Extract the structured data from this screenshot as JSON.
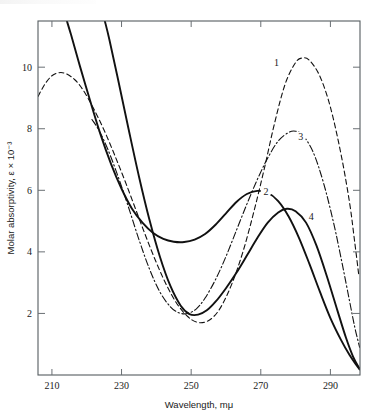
{
  "chart_data": {
    "type": "line",
    "title": "",
    "subtitle": "",
    "xlabel": "Wavelength, mμ",
    "ylabel": "Molar absorptivity, ε × 10⁻³",
    "xlim": [
      206,
      298.5
    ],
    "ylim": [
      0,
      11.5
    ],
    "xticks": [
      210,
      230,
      250,
      270,
      290
    ],
    "xticklabels": [
      "210",
      "230",
      "250",
      "270",
      "290"
    ],
    "yticks": [
      2,
      4,
      6,
      8,
      10
    ],
    "yticklabels": [
      "2",
      "4",
      "6",
      "8",
      "10"
    ],
    "grid": false,
    "legend_position": "inline-curve-labels",
    "annotations": [
      {
        "text": "1",
        "x": 274.5,
        "y": 10.05
      },
      {
        "text": "2",
        "x": 271.5,
        "y": 5.85
      },
      {
        "text": "3",
        "x": 281.5,
        "y": 7.65
      },
      {
        "text": "4",
        "x": 284.5,
        "y": 5.05
      }
    ],
    "series": [
      {
        "name": "1",
        "label": "1",
        "style": "dashed",
        "color": "#111111",
        "points": [
          [
            206.0,
            9.05
          ],
          [
            208.0,
            9.45
          ],
          [
            210.0,
            9.72
          ],
          [
            212.0,
            9.82
          ],
          [
            214.0,
            9.79
          ],
          [
            216.5,
            9.6
          ],
          [
            219.0,
            9.25
          ],
          [
            222.0,
            8.65
          ],
          [
            225.0,
            7.95
          ],
          [
            228.0,
            7.15
          ],
          [
            231.0,
            6.3
          ],
          [
            234.0,
            5.4
          ],
          [
            237.0,
            4.5
          ],
          [
            240.0,
            3.65
          ],
          [
            243.0,
            2.9
          ],
          [
            246.0,
            2.3
          ],
          [
            249.0,
            1.9
          ],
          [
            251.5,
            1.72
          ],
          [
            254.0,
            1.72
          ],
          [
            256.5,
            1.9
          ],
          [
            259.0,
            2.3
          ],
          [
            262.0,
            3.05
          ],
          [
            265.0,
            4.05
          ],
          [
            268.0,
            5.3
          ],
          [
            271.0,
            6.7
          ],
          [
            274.0,
            8.2
          ],
          [
            277.0,
            9.45
          ],
          [
            280.0,
            10.15
          ],
          [
            282.0,
            10.3
          ],
          [
            284.0,
            10.22
          ],
          [
            287.0,
            9.7
          ],
          [
            290.0,
            8.7
          ],
          [
            293.0,
            7.2
          ],
          [
            295.5,
            5.6
          ],
          [
            297.0,
            4.3
          ],
          [
            298.2,
            3.2
          ]
        ]
      },
      {
        "name": "2",
        "label": "2",
        "style": "solid",
        "color": "#111111",
        "points": [
          [
            214.3,
            11.5
          ],
          [
            215.5,
            11.05
          ],
          [
            218.0,
            10.05
          ],
          [
            221.0,
            8.9
          ],
          [
            224.0,
            7.8
          ],
          [
            227.0,
            6.85
          ],
          [
            230.0,
            6.05
          ],
          [
            233.0,
            5.4
          ],
          [
            236.0,
            4.95
          ],
          [
            239.0,
            4.62
          ],
          [
            242.0,
            4.42
          ],
          [
            245.0,
            4.33
          ],
          [
            248.0,
            4.32
          ],
          [
            251.0,
            4.4
          ],
          [
            254.0,
            4.58
          ],
          [
            257.0,
            4.88
          ],
          [
            260.0,
            5.25
          ],
          [
            263.0,
            5.62
          ],
          [
            266.0,
            5.88
          ],
          [
            269.0,
            5.98
          ],
          [
            272.0,
            5.92
          ],
          [
            275.0,
            5.65
          ],
          [
            278.0,
            5.15
          ],
          [
            281.0,
            4.45
          ],
          [
            284.0,
            3.6
          ],
          [
            287.0,
            2.7
          ],
          [
            290.0,
            1.85
          ],
          [
            293.0,
            1.15
          ],
          [
            295.5,
            0.65
          ],
          [
            297.5,
            0.32
          ],
          [
            298.4,
            0.18
          ]
        ]
      },
      {
        "name": "3",
        "label": "3",
        "style": "dashdot",
        "color": "#111111",
        "points": [
          [
            221.5,
            8.3
          ],
          [
            223.5,
            7.95
          ],
          [
            226.0,
            7.35
          ],
          [
            229.0,
            6.45
          ],
          [
            232.0,
            5.45
          ],
          [
            235.0,
            4.4
          ],
          [
            238.0,
            3.45
          ],
          [
            241.0,
            2.7
          ],
          [
            244.0,
            2.22
          ],
          [
            246.5,
            2.02
          ],
          [
            249.0,
            2.0
          ],
          [
            251.5,
            2.15
          ],
          [
            254.0,
            2.5
          ],
          [
            257.0,
            3.1
          ],
          [
            260.0,
            3.85
          ],
          [
            263.0,
            4.7
          ],
          [
            266.0,
            5.55
          ],
          [
            269.0,
            6.35
          ],
          [
            272.0,
            7.05
          ],
          [
            275.0,
            7.6
          ],
          [
            278.0,
            7.88
          ],
          [
            280.0,
            7.92
          ],
          [
            282.0,
            7.8
          ],
          [
            285.0,
            7.25
          ],
          [
            288.0,
            6.25
          ],
          [
            291.0,
            4.9
          ],
          [
            293.5,
            3.55
          ],
          [
            295.5,
            2.4
          ],
          [
            297.0,
            1.55
          ],
          [
            298.4,
            0.9
          ]
        ]
      },
      {
        "name": "4",
        "label": "4",
        "style": "solid",
        "color": "#111111",
        "points": [
          [
            225.2,
            11.5
          ],
          [
            226.5,
            10.9
          ],
          [
            229.0,
            9.6
          ],
          [
            232.0,
            8.0
          ],
          [
            235.0,
            6.45
          ],
          [
            238.0,
            5.05
          ],
          [
            241.0,
            3.85
          ],
          [
            244.0,
            2.9
          ],
          [
            247.0,
            2.25
          ],
          [
            249.5,
            1.98
          ],
          [
            252.0,
            1.96
          ],
          [
            254.5,
            2.1
          ],
          [
            257.0,
            2.38
          ],
          [
            260.0,
            2.82
          ],
          [
            263.0,
            3.32
          ],
          [
            266.0,
            3.88
          ],
          [
            269.0,
            4.45
          ],
          [
            272.0,
            4.95
          ],
          [
            275.0,
            5.28
          ],
          [
            277.5,
            5.4
          ],
          [
            280.0,
            5.32
          ],
          [
            283.0,
            4.95
          ],
          [
            286.0,
            4.2
          ],
          [
            289.0,
            3.2
          ],
          [
            292.0,
            2.1
          ],
          [
            294.5,
            1.2
          ],
          [
            296.5,
            0.6
          ],
          [
            298.4,
            0.2
          ]
        ]
      }
    ]
  },
  "figure": {
    "background_color": "#ffffff",
    "axis_color": "#555c60",
    "curve_color": "#111111"
  }
}
